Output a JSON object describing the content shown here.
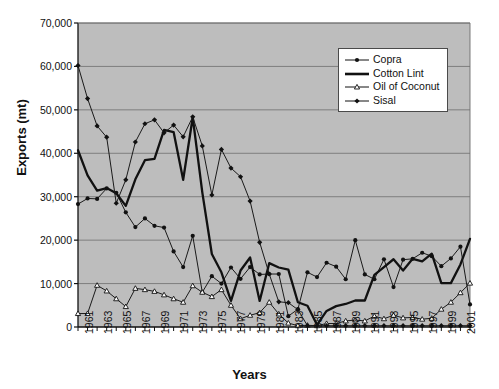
{
  "chart_data": {
    "type": "line",
    "title": "",
    "xlabel": "Years",
    "ylabel": "Exports (mt)",
    "ylim": [
      0,
      70000
    ],
    "yticks": [
      "0",
      "10,000",
      "20,000",
      "30,000",
      "40,000",
      "50,000",
      "60,000",
      "70,000"
    ],
    "ytick_values": [
      0,
      10000,
      20000,
      30000,
      40000,
      50000,
      60000,
      70000
    ],
    "grid": true,
    "plot_background": "#bdbdbd",
    "legend_position": "top-right",
    "x": [
      1961,
      1962,
      1963,
      1964,
      1965,
      1966,
      1967,
      1968,
      1969,
      1970,
      1971,
      1972,
      1973,
      1974,
      1975,
      1976,
      1977,
      1978,
      1979,
      1980,
      1981,
      1982,
      1983,
      1984,
      1985,
      1986,
      1987,
      1988,
      1989,
      1990,
      1991,
      1992,
      1993,
      1994,
      1995,
      1996,
      1997,
      1998,
      1999,
      2000,
      2001,
      2002
    ],
    "xtick_labels": [
      "1961",
      "1963",
      "1965",
      "1967",
      "1969",
      "1971",
      "1973",
      "1975",
      "1977",
      "1979",
      "1981",
      "1983",
      "1985",
      "1987",
      "1989",
      "1991",
      "1993",
      "1995",
      "1997",
      "1999",
      "2001"
    ],
    "xtick_values": [
      1961,
      1963,
      1965,
      1967,
      1969,
      1971,
      1973,
      1975,
      1977,
      1979,
      1981,
      1983,
      1985,
      1987,
      1989,
      1991,
      1993,
      1995,
      1997,
      1999,
      2001
    ],
    "series": [
      {
        "name": "Copra",
        "marker": "filled-dot",
        "line_width": 1,
        "color": "#1a1a1a",
        "values": [
          28300,
          29600,
          29500,
          31900,
          30900,
          26400,
          23000,
          25000,
          23300,
          22900,
          17400,
          13800,
          21000,
          8000,
          11700,
          10000,
          13700,
          11100,
          13800,
          12100,
          12200,
          12200,
          2500,
          4100,
          12600,
          11500,
          14800,
          13900,
          11000,
          20000,
          12100,
          11000,
          15600,
          9200,
          15500,
          15700,
          17100,
          16300,
          14000,
          15800,
          18500,
          5200
        ]
      },
      {
        "name": "Cotton Lint",
        "marker": "none",
        "line_width": 2.3,
        "color": "#111111",
        "values": [
          40700,
          34900,
          31400,
          32000,
          30800,
          27900,
          34000,
          38400,
          38700,
          45400,
          44900,
          33900,
          48300,
          31000,
          16800,
          12600,
          6000,
          13000,
          16000,
          6000,
          14700,
          13700,
          13200,
          5700,
          4900,
          500,
          3700,
          4800,
          5300,
          6100,
          6100,
          12000,
          13800,
          15600,
          13000,
          15700,
          15100,
          16900,
          10100,
          10100,
          14400,
          20300
        ]
      },
      {
        "name": "Oil of Coconut",
        "marker": "open-triangle",
        "line_width": 1,
        "color": "#1a1a1a",
        "values": [
          3100,
          3100,
          9600,
          8300,
          6500,
          4700,
          8900,
          8600,
          8200,
          7400,
          6500,
          5700,
          9500,
          8000,
          7000,
          8600,
          5000,
          1900,
          2700,
          3300,
          5700,
          3000,
          900,
          300,
          400,
          300,
          800,
          800,
          1400,
          1600,
          1400,
          2500,
          1900,
          2700,
          2100,
          2200,
          1800,
          2000,
          4100,
          5700,
          7900,
          10100
        ]
      },
      {
        "name": "Sisal",
        "marker": "filled-diamond",
        "line_width": 1,
        "color": "#1a1a1a",
        "values": [
          60200,
          52600,
          46300,
          43700,
          28500,
          33900,
          42600,
          46800,
          47700,
          44700,
          46500,
          43800,
          48400,
          41700,
          30400,
          40900,
          36600,
          34600,
          29000,
          19500,
          12200,
          5800,
          5600,
          4000,
          300,
          300,
          300,
          300,
          300,
          300,
          300,
          300,
          300,
          300,
          300,
          300,
          300,
          300,
          300,
          300,
          300,
          300
        ]
      }
    ]
  },
  "legend": {
    "items": [
      {
        "label": "Copra",
        "marker": "filled-dot"
      },
      {
        "label": "Cotton Lint",
        "marker": "thick-line"
      },
      {
        "label": "Oil of Coconut",
        "marker": "open-triangle"
      },
      {
        "label": "Sisal",
        "marker": "filled-diamond"
      }
    ]
  },
  "axes": {
    "y_title": "Exports (mt)",
    "x_title": "Years"
  }
}
